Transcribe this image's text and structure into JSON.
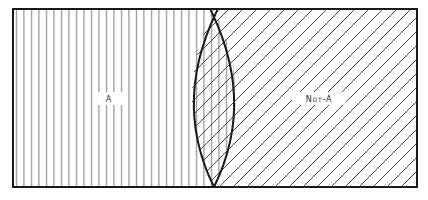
{
  "diagram": {
    "type": "venn-complement",
    "regions": [
      {
        "id": "a",
        "label": "A",
        "hatch": "vertical"
      },
      {
        "id": "not-a",
        "label": "Not-A",
        "hatch": "diagonal"
      },
      {
        "id": "overlap",
        "label": "",
        "hatch": "crosshatch"
      }
    ],
    "colors": {
      "background": "#ffffff",
      "border": "#1a1a1a",
      "vertical_hatch": "#7a7a7a",
      "diagonal_hatch": "#4a4a4a"
    }
  },
  "labels": {
    "a": "A",
    "not_a": "Not-A"
  }
}
